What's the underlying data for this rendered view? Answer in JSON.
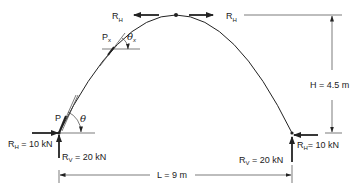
{
  "diagram": {
    "labels": {
      "rh": "R",
      "rh_sub": "H",
      "rv": "R",
      "rv_sub": "V",
      "left_rh_value": " = 10 kN",
      "left_rv_value": " = 20 kN",
      "right_rh_value": "= 10 kN",
      "right_rv_value": " = 20 kN",
      "point_p": "P",
      "point_px": "P",
      "point_px_sub": "x",
      "theta": "θ",
      "theta_x": "θ",
      "theta_x_sub": "x",
      "height": "H = 4.5 m",
      "span": "L = 9 m"
    },
    "values": {
      "span_m": 9,
      "rise_m": 4.5,
      "horizontal_reaction_kN": 10,
      "vertical_reaction_kN": 20
    },
    "colors": {
      "ink": "#222222",
      "background": "#ffffff"
    }
  }
}
